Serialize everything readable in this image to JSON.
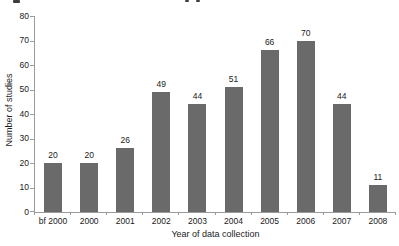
{
  "chart_data": {
    "type": "bar",
    "title": "",
    "categories": [
      "bf 2000",
      "2000",
      "2001",
      "2002",
      "2003",
      "2004",
      "2005",
      "2006",
      "2007",
      "2008"
    ],
    "values": [
      20,
      20,
      26,
      49,
      44,
      51,
      66,
      70,
      44,
      11
    ],
    "xlabel": "Year of data collection",
    "ylabel": "Number of studies",
    "ylim": [
      0,
      80
    ],
    "yticks": [
      0,
      10,
      20,
      30,
      40,
      50,
      60,
      70,
      80
    ],
    "grid": false,
    "legend": "none",
    "bar_color": "#6a6a6a",
    "value_labels_shown": true
  }
}
